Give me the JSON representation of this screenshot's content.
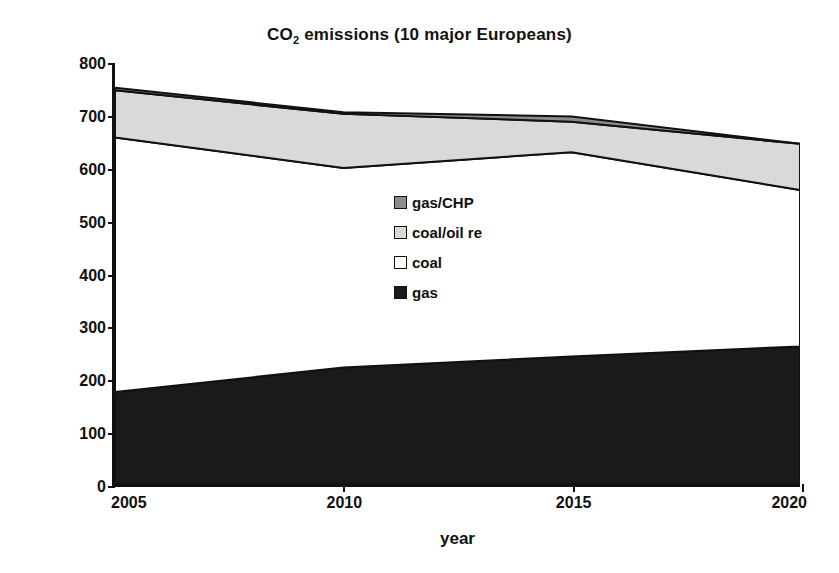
{
  "chart_data": {
    "type": "area",
    "stacked": true,
    "title": "CO2 emissions (10 major Europeans)",
    "title_main": "CO",
    "title_sub": "2",
    "title_rest": " emissions (10 major Europeans)",
    "xlabel": "year",
    "ylabel": "CO2 mt",
    "ylabel_main": "CO",
    "ylabel_sub": "2",
    "ylabel_rest": " mt",
    "x": [
      2005,
      2010,
      2015,
      2020
    ],
    "xticklabels": [
      "2005",
      "2010",
      "2015",
      "2020"
    ],
    "yticks": [
      0,
      100,
      200,
      300,
      400,
      500,
      600,
      700,
      800
    ],
    "yticklabels": [
      "0",
      "100",
      "200",
      "300",
      "400",
      "500",
      "600",
      "700",
      "800"
    ],
    "xlim": [
      2005,
      2020
    ],
    "ylim": [
      0,
      800
    ],
    "grid": false,
    "legend_position": "center",
    "series": [
      {
        "name": "gas",
        "values": [
          175,
          222,
          243,
          262
        ],
        "color": "#1a1a1a"
      },
      {
        "name": "coal",
        "values": [
          485,
          380,
          389,
          298
        ],
        "color": "#ffffff"
      },
      {
        "name": "coal/oil re",
        "values": [
          90,
          103,
          58,
          88
        ],
        "color": "#d9d9d9"
      },
      {
        "name": "gas/CHP",
        "values": [
          5,
          3,
          10,
          0
        ],
        "color": "#8c8c8c"
      }
    ],
    "cumulative": {
      "gas": [
        175,
        222,
        243,
        262
      ],
      "coal": [
        660,
        602,
        632,
        560
      ],
      "coal_oil_re": [
        750,
        705,
        690,
        648
      ],
      "gas_chp": [
        755,
        708,
        700,
        648
      ]
    },
    "legend": [
      {
        "label": "gas/CHP",
        "color": "#8c8c8c"
      },
      {
        "label": "coal/oil re",
        "color": "#d9d9d9"
      },
      {
        "label": "coal",
        "color": "#ffffff"
      },
      {
        "label": "gas",
        "color": "#1a1a1a"
      }
    ],
    "stroke_color": "#111111",
    "axis_color": "#111111",
    "background": "#ffffff"
  }
}
